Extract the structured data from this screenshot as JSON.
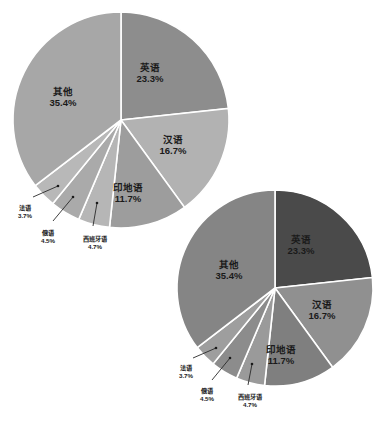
{
  "figure": {
    "background": "#ffffff",
    "label_color": "#1a1a1a",
    "slice_border_color": "#ffffff"
  },
  "chart_data": [
    {
      "type": "pie",
      "title": "",
      "subtitle": "",
      "xlabel": "",
      "ylabel": "",
      "legend": "none",
      "grid": false,
      "start_angle_deg": 0,
      "direction": "clockwise",
      "categories": [
        "英语",
        "汉语",
        "印地语",
        "西班牙语",
        "俄语",
        "法语",
        "其他"
      ],
      "values": [
        23.3,
        16.7,
        11.7,
        4.7,
        4.5,
        3.7,
        35.4
      ],
      "value_labels": [
        "23.3%",
        "16.7%",
        "11.7%",
        "4.7%",
        "4.5%",
        "3.7%",
        "35.4%"
      ],
      "colors": [
        "#8d8d8d",
        "#b2b2b2",
        "#9d9d9d",
        "#b6b6b6",
        "#aaaaaa",
        "#b8b8b8",
        "#a7a7a7"
      ],
      "label_placement": [
        "inside",
        "inside",
        "inside",
        "outside",
        "outside",
        "outside",
        "inside"
      ],
      "geometry": {
        "cx": 121,
        "cy": 120,
        "r": 108
      }
    },
    {
      "type": "pie",
      "title": "",
      "subtitle": "",
      "xlabel": "",
      "ylabel": "",
      "legend": "none",
      "grid": false,
      "start_angle_deg": 0,
      "direction": "clockwise",
      "categories": [
        "英语",
        "汉语",
        "印地语",
        "西班牙语",
        "俄语",
        "法语",
        "其他"
      ],
      "values": [
        23.3,
        16.7,
        11.7,
        4.7,
        4.5,
        3.7,
        35.4
      ],
      "value_labels": [
        "23.3%",
        "16.7%",
        "11.7%",
        "4.7%",
        "4.5%",
        "3.7%",
        "35.4%"
      ],
      "colors": [
        "#4a4a4a",
        "#909090",
        "#7f7f7f",
        "#9a9a9a",
        "#8c8c8c",
        "#9e9e9e",
        "#858585"
      ],
      "label_placement": [
        "inside",
        "inside",
        "inside",
        "outside",
        "outside",
        "outside",
        "inside"
      ],
      "geometry": {
        "cx": 275,
        "cy": 288,
        "r": 98
      }
    }
  ],
  "charts": [
    {
      "name": "pie-chart-top-left",
      "slices": [
        {
          "label": "英语",
          "pct": "23.3%",
          "lx": 150,
          "ly": 68,
          "placement": "inside"
        },
        {
          "label": "汉语",
          "pct": "16.7%",
          "lx": 173,
          "ly": 140,
          "placement": "inside"
        },
        {
          "label": "印地语",
          "pct": "11.7%",
          "lx": 128,
          "ly": 188,
          "placement": "inside"
        },
        {
          "label": "西班牙语",
          "pct": "4.7%",
          "lx": 95,
          "ly": 239,
          "placement": "outside",
          "dot_x": 97,
          "dot_y": 203,
          "bend_x": 93,
          "bend_y": 226
        },
        {
          "label": "俄语",
          "pct": "4.5%",
          "lx": 48,
          "ly": 233,
          "placement": "outside",
          "dot_x": 73,
          "dot_y": 197,
          "bend_x": 53,
          "bend_y": 221
        },
        {
          "label": "法语",
          "pct": "3.7%",
          "lx": 25,
          "ly": 208,
          "placement": "outside",
          "dot_x": 58,
          "dot_y": 186,
          "bend_x": 33,
          "bend_y": 197
        },
        {
          "label": "其他",
          "pct": "35.4%",
          "lx": 63,
          "ly": 92,
          "placement": "inside"
        }
      ]
    },
    {
      "name": "pie-chart-bottom-right",
      "slices": [
        {
          "label": "英语",
          "pct": "23.3%",
          "lx": 301,
          "ly": 240,
          "placement": "inside"
        },
        {
          "label": "汉语",
          "pct": "16.7%",
          "lx": 322,
          "ly": 305,
          "placement": "inside"
        },
        {
          "label": "印地语",
          "pct": "11.7%",
          "lx": 281,
          "ly": 350,
          "placement": "inside"
        },
        {
          "label": "西班牙语",
          "pct": "4.7%",
          "lx": 250,
          "ly": 397,
          "placement": "outside",
          "dot_x": 252,
          "dot_y": 364,
          "bend_x": 248,
          "bend_y": 385
        },
        {
          "label": "俄语",
          "pct": "4.5%",
          "lx": 207,
          "ly": 391,
          "placement": "outside",
          "dot_x": 230,
          "dot_y": 358,
          "bend_x": 212,
          "bend_y": 380
        },
        {
          "label": "法语",
          "pct": "3.7%",
          "lx": 186,
          "ly": 368,
          "placement": "outside",
          "dot_x": 216,
          "dot_y": 348,
          "bend_x": 193,
          "bend_y": 358
        },
        {
          "label": "其他",
          "pct": "35.4%",
          "lx": 229,
          "ly": 265,
          "placement": "inside"
        }
      ]
    }
  ]
}
